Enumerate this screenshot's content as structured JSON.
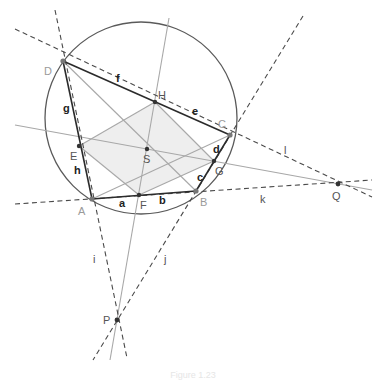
{
  "diagram": {
    "colors": {
      "circle": "#5a5a5a",
      "edge": "#2b2b2b",
      "light_line": "#a8a8a8",
      "dashed_line": "#4a4a4a",
      "shade": "#eeeeee",
      "point": "#333333",
      "vertex_label": "#9a9a9a",
      "label": "#222222"
    },
    "circle": {
      "cx": 141,
      "cy": 118,
      "r": 96
    },
    "points": {
      "A": {
        "x": 92,
        "y": 199,
        "label": "A"
      },
      "B": {
        "x": 196,
        "y": 191,
        "label": "B"
      },
      "C": {
        "x": 230,
        "y": 135,
        "label": "C"
      },
      "D": {
        "x": 63,
        "y": 61,
        "label": "D"
      },
      "E": {
        "x": 79,
        "y": 146,
        "label": "E"
      },
      "F": {
        "x": 139,
        "y": 195,
        "label": "F"
      },
      "G": {
        "x": 214,
        "y": 161,
        "label": "G"
      },
      "H": {
        "x": 155,
        "y": 102,
        "label": "H"
      },
      "S": {
        "x": 147,
        "y": 149,
        "label": "S"
      },
      "P": {
        "x": 117,
        "y": 320,
        "label": "P"
      },
      "Q": {
        "x": 338,
        "y": 184,
        "label": "Q"
      }
    },
    "segment_labels": {
      "a": "a",
      "b": "b",
      "c": "c",
      "d": "d",
      "e": "e",
      "f": "f",
      "g": "g",
      "h": "h",
      "i": "i",
      "j": "j",
      "k": "k",
      "l": "l"
    },
    "caption": "Figure 1.23"
  }
}
